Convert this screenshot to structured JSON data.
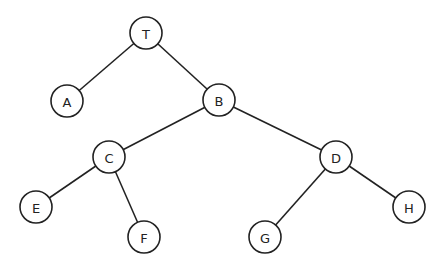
{
  "diagram": {
    "type": "binary-tree",
    "root": "T",
    "node_radius": 16,
    "colors": {
      "stroke": "#222222",
      "fill": "#ffffff",
      "text": "#222222",
      "background": "#ffffff"
    },
    "nodes": [
      {
        "id": "T",
        "label": "T",
        "x": 146,
        "y": 33
      },
      {
        "id": "A",
        "label": "A",
        "x": 67,
        "y": 101
      },
      {
        "id": "B",
        "label": "B",
        "x": 219,
        "y": 100
      },
      {
        "id": "C",
        "label": "C",
        "x": 109,
        "y": 157
      },
      {
        "id": "D",
        "label": "D",
        "x": 336,
        "y": 157
      },
      {
        "id": "E",
        "label": "E",
        "x": 36,
        "y": 207
      },
      {
        "id": "F",
        "label": "F",
        "x": 144,
        "y": 237
      },
      {
        "id": "G",
        "label": "G",
        "x": 265,
        "y": 237
      },
      {
        "id": "H",
        "label": "H",
        "x": 409,
        "y": 207
      }
    ],
    "edges": [
      {
        "from": "T",
        "to": "A"
      },
      {
        "from": "T",
        "to": "B"
      },
      {
        "from": "B",
        "to": "C"
      },
      {
        "from": "B",
        "to": "D"
      },
      {
        "from": "C",
        "to": "E"
      },
      {
        "from": "C",
        "to": "F"
      },
      {
        "from": "D",
        "to": "G"
      },
      {
        "from": "D",
        "to": "H"
      }
    ]
  }
}
